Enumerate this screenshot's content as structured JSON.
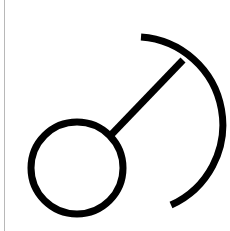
{
  "diagram": {
    "stroke_color": "#000000",
    "background": "#ffffff",
    "border_color": "#b8b8b8",
    "stroke_width": 7,
    "circle": {
      "cx": 77,
      "cy": 168,
      "r": 46
    },
    "connector": {
      "x1": 110,
      "y1": 136,
      "x2": 183,
      "y2": 60
    },
    "arc": {
      "start": [
        141,
        37
      ],
      "end": [
        171,
        205
      ],
      "radius": 88
    }
  }
}
